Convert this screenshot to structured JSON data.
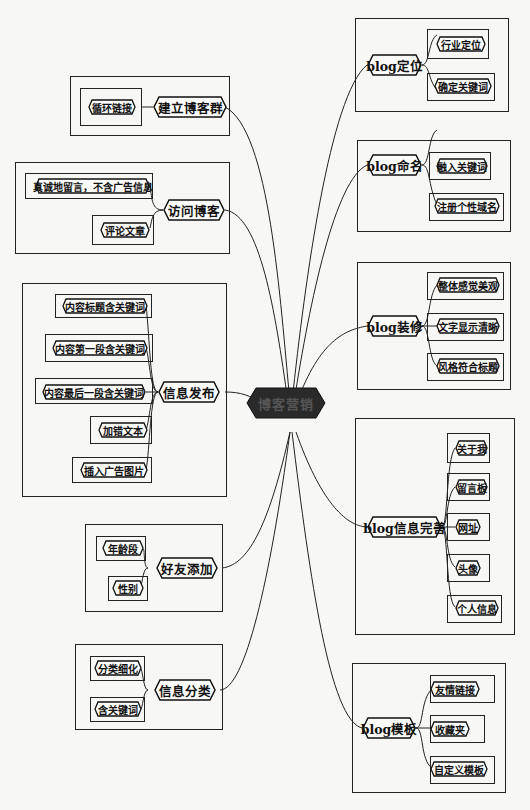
{
  "diagram": {
    "type": "mind-map",
    "center": {
      "label": "博客营销",
      "fill": "#2a2a2a"
    },
    "branches": [
      {
        "id": "b1",
        "label": "建立博客群",
        "side": "left",
        "children": [
          "循环链接"
        ]
      },
      {
        "id": "b2",
        "label": "访问博客",
        "side": "left",
        "children": [
          "真诚地留言，不含广告信息",
          "评论文章"
        ]
      },
      {
        "id": "b3",
        "label": "信息发布",
        "side": "left",
        "children": [
          "内容标题含关键词",
          "内容第一段含关键词",
          "内容最后一段含关键词",
          "加错文本",
          "插入广告图片"
        ]
      },
      {
        "id": "b4",
        "label": "好友添加",
        "side": "left",
        "children": [
          "年龄段",
          "性别"
        ]
      },
      {
        "id": "b5",
        "label": "信息分类",
        "side": "left",
        "children": [
          "分类细化",
          "含关键词"
        ]
      },
      {
        "id": "b6",
        "label": "blog定位",
        "side": "right",
        "children": [
          "行业定位",
          "确定关键词"
        ]
      },
      {
        "id": "b7",
        "label": "blog命名",
        "side": "right",
        "children": [
          "融入关键词",
          "注册个性域名"
        ]
      },
      {
        "id": "b8",
        "label": "blog装修",
        "side": "right",
        "children": [
          "整体感觉美观",
          "文字显示清晰",
          "风格符合标题"
        ]
      },
      {
        "id": "b9",
        "label": "blog信息完善",
        "side": "right",
        "children": [
          "关于我",
          "留言板",
          "网址",
          "头像",
          "个人信息"
        ]
      },
      {
        "id": "b10",
        "label": "blog模板",
        "side": "right",
        "children": [
          "友情链接",
          "收藏夹",
          "自定义模板"
        ]
      }
    ]
  }
}
